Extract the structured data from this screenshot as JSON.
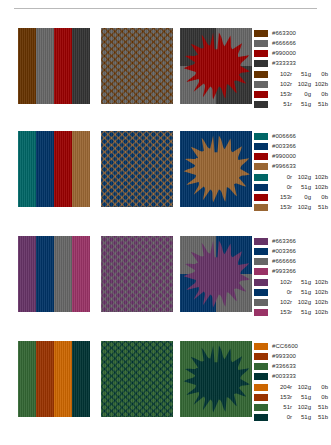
{
  "page": {
    "divider": "horizontal-rule"
  },
  "rows": [
    {
      "id": "row-1",
      "panels": [
        {
          "name": "stripes-panel",
          "type": "stripes"
        },
        {
          "name": "dots-panel",
          "type": "dots"
        },
        {
          "name": "sun-panel",
          "type": "sun"
        }
      ],
      "swatches": [
        {
          "hex": "#663300",
          "hex_label": "#663300",
          "r": "102r",
          "g": "51g",
          "b": "0b"
        },
        {
          "hex": "#666666",
          "hex_label": "#666666",
          "r": "102r",
          "g": "102g",
          "b": "102b"
        },
        {
          "hex": "#990000",
          "hex_label": "#990000",
          "r": "153r",
          "g": "0g",
          "b": "0b"
        },
        {
          "hex": "#333333",
          "hex_label": "#333333",
          "r": "51r",
          "g": "51g",
          "b": "51b"
        }
      ]
    },
    {
      "id": "row-2",
      "panels": [
        {
          "name": "stripes-panel",
          "type": "stripes"
        },
        {
          "name": "dots-panel",
          "type": "dots"
        },
        {
          "name": "sun-panel",
          "type": "sun"
        }
      ],
      "swatches": [
        {
          "hex": "#006666",
          "hex_label": "#006666",
          "r": "0r",
          "g": "102g",
          "b": "102b"
        },
        {
          "hex": "#003366",
          "hex_label": "#003366",
          "r": "0r",
          "g": "51g",
          "b": "102b"
        },
        {
          "hex": "#990000",
          "hex_label": "#990000",
          "r": "153r",
          "g": "0g",
          "b": "0b"
        },
        {
          "hex": "#996633",
          "hex_label": "#996633",
          "r": "153r",
          "g": "102g",
          "b": "51b"
        }
      ]
    },
    {
      "id": "row-3",
      "panels": [
        {
          "name": "stripes-panel",
          "type": "stripes"
        },
        {
          "name": "dots-panel",
          "type": "dots"
        },
        {
          "name": "sun-panel",
          "type": "sun"
        }
      ],
      "swatches": [
        {
          "hex": "#663366",
          "hex_label": "#663366",
          "r": "102r",
          "g": "51g",
          "b": "102b"
        },
        {
          "hex": "#003366",
          "hex_label": "#003366",
          "r": "0r",
          "g": "51g",
          "b": "102b"
        },
        {
          "hex": "#666666",
          "hex_label": "#666666",
          "r": "102r",
          "g": "102g",
          "b": "102b"
        },
        {
          "hex": "#993366",
          "hex_label": "#993366",
          "r": "153r",
          "g": "51g",
          "b": "102b"
        }
      ]
    },
    {
      "id": "row-4",
      "panels": [
        {
          "name": "stripes-panel",
          "type": "stripes"
        },
        {
          "name": "dots-panel",
          "type": "dots"
        },
        {
          "name": "sun-panel",
          "type": "sun"
        }
      ],
      "swatches": [
        {
          "hex": "#CC6600",
          "hex_label": "#CC6600",
          "r": "204r",
          "g": "102g",
          "b": "0b"
        },
        {
          "hex": "#993300",
          "hex_label": "#993300",
          "r": "153r",
          "g": "51g",
          "b": "0b"
        },
        {
          "hex": "#336633",
          "hex_label": "#336633",
          "r": "51r",
          "g": "102g",
          "b": "51b"
        },
        {
          "hex": "#003333",
          "hex_label": "#003333",
          "r": "0r",
          "g": "51g",
          "b": "51b"
        }
      ]
    }
  ]
}
